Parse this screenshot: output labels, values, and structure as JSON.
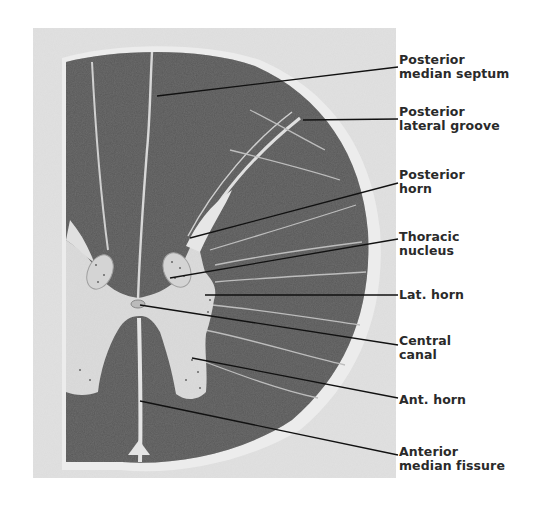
{
  "figure": {
    "colors": {
      "background_panel": "#e4e4e4",
      "white_matter": "#555555",
      "gray_matter": "#dcdcdc",
      "leader_line": "#111111",
      "label_text": "#2a2a2a"
    }
  },
  "labels": [
    {
      "id": "posterior-median-septum",
      "line1": "Posterior",
      "line2": "median septum",
      "top": 53,
      "anchor": [
        157,
        96
      ],
      "end": [
        398,
        67
      ]
    },
    {
      "id": "posterior-lateral-groove",
      "line1": "Posterior",
      "line2": "lateral groove",
      "top": 105,
      "anchor": [
        303,
        120
      ],
      "end": [
        398,
        119
      ]
    },
    {
      "id": "posterior-horn",
      "line1": "Posterior",
      "line2": "horn",
      "top": 168,
      "anchor": [
        190,
        238
      ],
      "end": [
        398,
        183
      ]
    },
    {
      "id": "thoracic-nucleus",
      "line1": "Thoracic",
      "line2": "nucleus",
      "top": 230,
      "anchor": [
        170,
        278
      ],
      "end": [
        398,
        239
      ]
    },
    {
      "id": "lat-horn",
      "line1": "Lat. horn",
      "line2": "",
      "top": 287,
      "anchor": [
        205,
        295
      ],
      "end": [
        398,
        295
      ]
    },
    {
      "id": "central-canal",
      "line1": "Central",
      "line2": "canal",
      "top": 334,
      "anchor": [
        140,
        305
      ],
      "end": [
        398,
        345
      ]
    },
    {
      "id": "ant-horn",
      "line1": "Ant. horn",
      "line2": "",
      "top": 392,
      "anchor": [
        192,
        358
      ],
      "end": [
        398,
        398
      ]
    },
    {
      "id": "anterior-median-fissure",
      "line1": "Anterior",
      "line2": "median fissure",
      "top": 445,
      "anchor": [
        140,
        401
      ],
      "end": [
        398,
        455
      ]
    }
  ]
}
